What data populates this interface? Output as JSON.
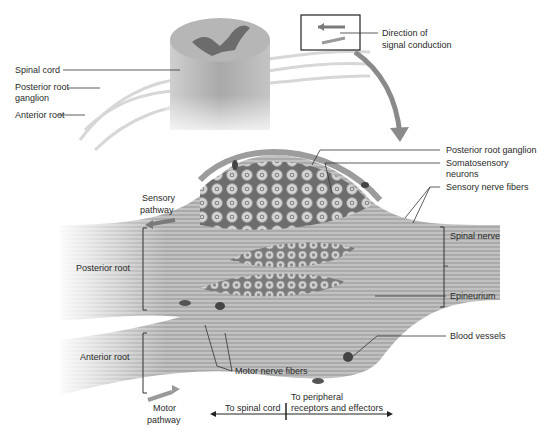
{
  "figure": {
    "top_labels": {
      "spinal_cord": "Spinal cord",
      "posterior_root_ganglion_line1": "Posterior root",
      "posterior_root_ganglion_line2": "ganglion",
      "anterior_root": "Anterior root",
      "direction_line1": "Direction of",
      "direction_line2": "signal conduction"
    },
    "detail_labels": {
      "posterior_root_ganglion": "Posterior root ganglion",
      "somatosensory_line1": "Somatosensory",
      "somatosensory_line2": "neurons",
      "sensory_nerve_fibers": "Sensory nerve fibers",
      "spinal_nerve": "Spinal nerve",
      "epineurium": "Epineurium",
      "blood_vessels": "Blood vessels",
      "motor_nerve_fibers": "Motor nerve fibers",
      "sensory_pathway_line1": "Sensory",
      "sensory_pathway_line2": "pathway",
      "posterior_root": "Posterior root",
      "anterior_root": "Anterior root",
      "motor_pathway_line1": "Motor",
      "motor_pathway_line2": "pathway",
      "to_spinal_cord": "To spinal cord",
      "to_peripheral_line1": "To peripheral",
      "to_peripheral_line2": "receptors and effectors"
    },
    "colors": {
      "tissue_light": "#d9d9d9",
      "tissue_mid": "#a8a8a8",
      "tissue_dark": "#5a5a5a",
      "arrow": "#7a7a7a",
      "leader": "#333333"
    }
  }
}
